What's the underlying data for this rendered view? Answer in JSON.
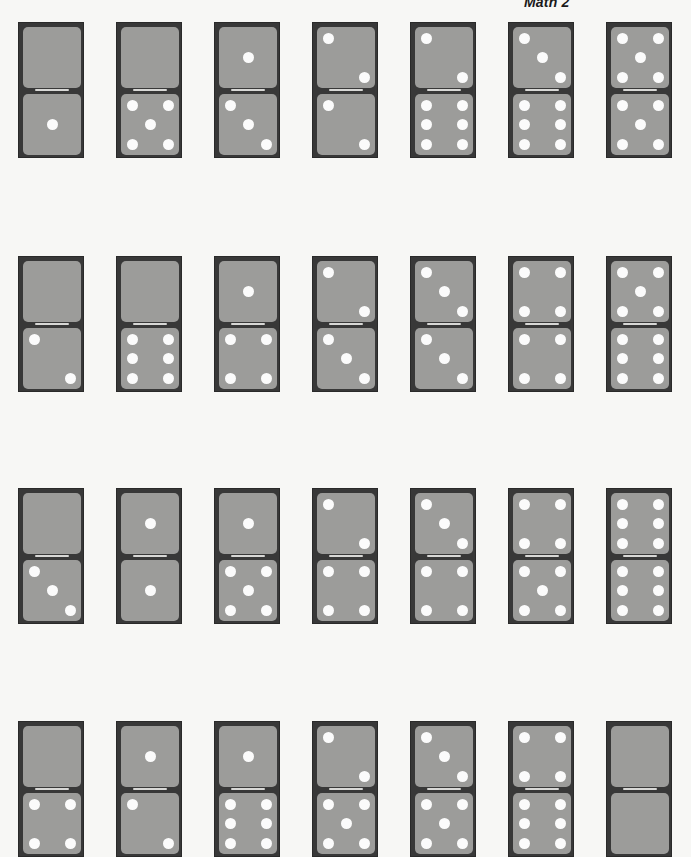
{
  "header": {
    "title": "Math 2"
  },
  "colors": {
    "page_background": "#f7f7f5",
    "domino_frame": "#383838",
    "domino_face": "#9c9c9a",
    "pip": "#fbfbfb",
    "divider_line": "#d8d8d6"
  },
  "layout": {
    "column_x": [
      18,
      116,
      214,
      312,
      410,
      508,
      606
    ],
    "row_y": [
      22,
      256,
      488,
      721
    ]
  },
  "dominoes": [
    [
      {
        "top": 0,
        "bottom": 1
      },
      {
        "top": 0,
        "bottom": 5
      },
      {
        "top": 1,
        "bottom": 3
      },
      {
        "top": 2,
        "bottom": 2
      },
      {
        "top": 2,
        "bottom": 6
      },
      {
        "top": 3,
        "bottom": 6
      },
      {
        "top": 5,
        "bottom": 5
      }
    ],
    [
      {
        "top": 0,
        "bottom": 2
      },
      {
        "top": 0,
        "bottom": 6
      },
      {
        "top": 1,
        "bottom": 4
      },
      {
        "top": 2,
        "bottom": 3
      },
      {
        "top": 3,
        "bottom": 3
      },
      {
        "top": 4,
        "bottom": 4
      },
      {
        "top": 5,
        "bottom": 6
      }
    ],
    [
      {
        "top": 0,
        "bottom": 3
      },
      {
        "top": 1,
        "bottom": 1
      },
      {
        "top": 1,
        "bottom": 5
      },
      {
        "top": 2,
        "bottom": 4
      },
      {
        "top": 3,
        "bottom": 4
      },
      {
        "top": 4,
        "bottom": 5
      },
      {
        "top": 6,
        "bottom": 6
      }
    ],
    [
      {
        "top": 0,
        "bottom": 4
      },
      {
        "top": 1,
        "bottom": 2
      },
      {
        "top": 1,
        "bottom": 6
      },
      {
        "top": 2,
        "bottom": 5
      },
      {
        "top": 3,
        "bottom": 5
      },
      {
        "top": 4,
        "bottom": 6
      },
      {
        "top": 0,
        "bottom": 0
      }
    ]
  ]
}
